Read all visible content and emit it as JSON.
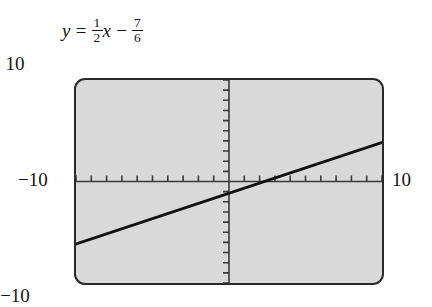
{
  "equation": {
    "lhs": "y",
    "equals": "=",
    "coef_num": "1",
    "coef_den": "2",
    "variable": "x",
    "operator": "−",
    "const_num": "7",
    "const_den": "6",
    "plain": "y = 1/2 x − 7/6"
  },
  "screen": {
    "background_color": "#d9d9d9",
    "border_color": "#2a2a2a",
    "line_color": "#111111",
    "axis_color": "#3a3a3a"
  },
  "labels": {
    "top": "10",
    "bottom": "−10",
    "left": "−10",
    "right": "10"
  },
  "chart_data": {
    "type": "line",
    "title": "",
    "subtitle": "",
    "equation": "y = (1/2)x − 7/6",
    "slope": 0.5,
    "intercept": -1.1667,
    "xlabel": "x",
    "ylabel": "y",
    "xlim": [
      -10,
      10
    ],
    "ylim": [
      -10,
      10
    ],
    "xticks": [
      -10,
      -9,
      -8,
      -7,
      -6,
      -5,
      -4,
      -3,
      -2,
      -1,
      1,
      2,
      3,
      4,
      5,
      6,
      7,
      8,
      9,
      10
    ],
    "yticks": [
      -10,
      -9,
      -8,
      -7,
      -6,
      -5,
      -4,
      -3,
      -2,
      -1,
      1,
      2,
      3,
      4,
      5,
      6,
      7,
      8,
      9,
      10
    ],
    "tick_labels": {
      "x_min": "−10",
      "x_max": "10",
      "y_min": "−10",
      "y_max": "10"
    },
    "grid": false,
    "legend": null,
    "series": [
      {
        "name": "y = (1/2)x − 7/6",
        "x": [
          -10,
          -5,
          0,
          2.3333,
          5,
          10
        ],
        "y": [
          -6.1667,
          -3.6667,
          -1.1667,
          0,
          1.3333,
          3.8333
        ]
      }
    ],
    "x_intercept": 2.3333,
    "y_intercept": -1.1667,
    "annotations": []
  }
}
